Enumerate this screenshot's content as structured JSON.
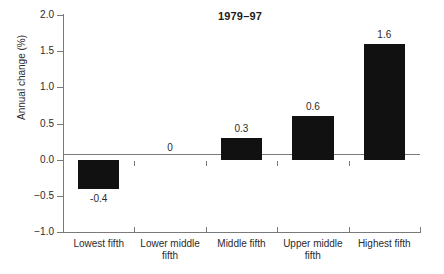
{
  "chart_data": {
    "type": "bar",
    "title": "1979–97",
    "xlabel": "",
    "ylabel": "Annual change (%)",
    "ylim": [
      -1.0,
      2.0
    ],
    "grid": false,
    "legend": "none",
    "categories": [
      "Lowest fifth",
      "Lower middle fifth",
      "Middle fifth",
      "Upper middle fifth",
      "Highest fifth"
    ],
    "category_lines": [
      [
        "Lowest fifth"
      ],
      [
        "Lower middle",
        "fifth"
      ],
      [
        "Middle fifth"
      ],
      [
        "Upper middle",
        "fifth"
      ],
      [
        "Highest fifth"
      ]
    ],
    "values": [
      -0.4,
      0,
      0.3,
      0.6,
      1.6
    ],
    "value_labels": [
      "-0.4",
      "0",
      "0.3",
      "0.6",
      "1.6"
    ],
    "ytick_labels": [
      "2.0",
      "1.5",
      "1.0",
      "0.5",
      "0.0",
      "−0.5",
      "−1.0"
    ],
    "ytick_values": [
      2.0,
      1.5,
      1.0,
      0.5,
      0.0,
      -0.5,
      -1.0
    ],
    "bar_color": "#111111",
    "axis_color": "#7a7a7a",
    "text_color": "#2b2b2b"
  }
}
